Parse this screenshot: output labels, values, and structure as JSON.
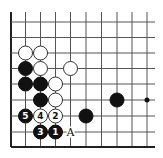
{
  "diagram": {
    "type": "go-board-fragment",
    "colors": {
      "background": "#ffffff",
      "grid": "#555555",
      "edge": "#222222",
      "black_stone": "#111111",
      "white_stone": "#ffffff"
    },
    "grid": {
      "columns_x": [
        11,
        25.5,
        40.5,
        55.5,
        70.5,
        86,
        101.5,
        117,
        132,
        147
      ],
      "rows_y": [
        22,
        37.5,
        53,
        68.5,
        84,
        100,
        116,
        132,
        147
      ],
      "left_edge": true,
      "bottom_edge": true,
      "top_extend_to": 12,
      "right_extend_to": 155,
      "stone_radius": 7
    },
    "stones": [
      {
        "color": "white",
        "col": 1,
        "row": 2,
        "label": ""
      },
      {
        "color": "white",
        "col": 2,
        "row": 2,
        "label": ""
      },
      {
        "color": "black",
        "col": 1,
        "row": 3,
        "label": ""
      },
      {
        "color": "white",
        "col": 2,
        "row": 3,
        "label": ""
      },
      {
        "color": "white",
        "col": 4,
        "row": 3,
        "label": ""
      },
      {
        "color": "black",
        "col": 1,
        "row": 4,
        "label": ""
      },
      {
        "color": "black",
        "col": 2,
        "row": 4,
        "label": ""
      },
      {
        "color": "white",
        "col": 3,
        "row": 4,
        "label": ""
      },
      {
        "color": "black",
        "col": 2,
        "row": 5,
        "label": ""
      },
      {
        "color": "white",
        "col": 3,
        "row": 5,
        "label": ""
      },
      {
        "color": "black",
        "col": 7,
        "row": 5,
        "label": ""
      },
      {
        "color": "black",
        "col": 1,
        "row": 6,
        "label": "5"
      },
      {
        "color": "white",
        "col": 2,
        "row": 6,
        "label": "4"
      },
      {
        "color": "white",
        "col": 3,
        "row": 6,
        "label": "2"
      },
      {
        "color": "black",
        "col": 5,
        "row": 6,
        "label": ""
      },
      {
        "color": "black",
        "col": 2,
        "row": 7,
        "label": "3"
      },
      {
        "color": "black",
        "col": 3,
        "row": 7,
        "label": "1"
      }
    ],
    "hoshi": [
      {
        "col": 9,
        "row": 5
      }
    ],
    "point_labels": [
      {
        "col": 4,
        "row": 7,
        "text": "A"
      }
    ]
  }
}
